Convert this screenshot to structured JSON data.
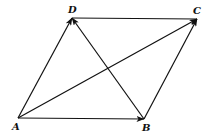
{
  "diagram": {
    "type": "parallelogram-vectors",
    "points": {
      "A": {
        "label": "A",
        "x": 18,
        "y": 118,
        "lx": 12,
        "ly": 130
      },
      "B": {
        "label": "B",
        "x": 144,
        "y": 119,
        "lx": 142,
        "ly": 131
      },
      "C": {
        "label": "C",
        "x": 197,
        "y": 19,
        "lx": 193,
        "ly": 14
      },
      "D": {
        "label": "D",
        "x": 72,
        "y": 18,
        "lx": 68,
        "ly": 13
      }
    },
    "edges": [
      {
        "from": "A",
        "to": "B",
        "arrow": true
      },
      {
        "from": "A",
        "to": "D",
        "arrow": true
      },
      {
        "from": "A",
        "to": "C",
        "arrow": true
      },
      {
        "from": "B",
        "to": "C",
        "arrow": true
      },
      {
        "from": "B",
        "to": "D",
        "arrow": true
      },
      {
        "from": "D",
        "to": "C",
        "arrow": false
      }
    ],
    "stroke_color": "#111111"
  }
}
